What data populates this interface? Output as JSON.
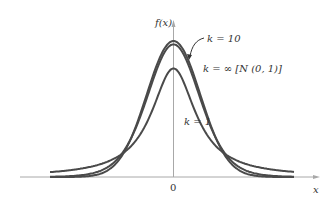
{
  "chart_data": {
    "type": "line",
    "title": "",
    "xlabel": "x",
    "ylabel": "f(x)",
    "x_ticks": [
      "0"
    ],
    "xlim": [
      -4.5,
      4.5
    ],
    "grid": false,
    "legend": "inline annotations",
    "series": [
      {
        "name": "k = ∞ [N (0, 1)]",
        "df": "inf",
        "peak": 0.399
      },
      {
        "name": "k = 10",
        "df": 10,
        "peak": 0.389
      },
      {
        "name": "k = 1",
        "df": 1,
        "peak": 0.318
      }
    ],
    "annotations": [
      {
        "text": "k = 10",
        "arrow_to": "middle curve"
      },
      {
        "text": "k = ∞ [N (0, 1)]"
      },
      {
        "text": "k = 1"
      }
    ]
  },
  "labels": {
    "y_axis": "f(x)",
    "x_axis": "x",
    "origin": "0",
    "k10": "k = 10",
    "kinf": "k = ∞ [N (0, 1)]",
    "k1": "k = 1"
  },
  "colors": {
    "curve": "#4a4a4a",
    "axis": "#a8a8a8",
    "text": "#333333"
  }
}
